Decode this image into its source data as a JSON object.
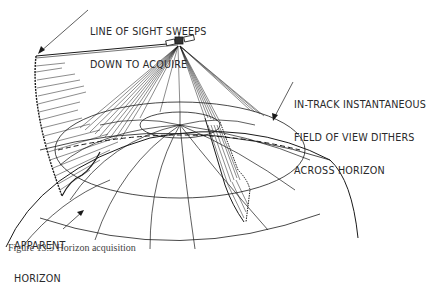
{
  "figure": {
    "labels": {
      "line_of_sight": [
        "LINE OF SIGHT SWEEPS",
        "DOWN TO ACQUIRE"
      ],
      "field_of_view": [
        "IN-TRACK INSTANTANEOUS",
        "FIELD OF VIEW DITHERS",
        "ACROSS HORIZON"
      ],
      "apparent_horizon": [
        "APPARENT",
        "HORIZON"
      ]
    },
    "caption": "Figure 13.5   Horizon acquisition"
  },
  "colors": {
    "background": "#ffffff",
    "ink": "#1a1a1a",
    "text": "#2a2a2a"
  }
}
